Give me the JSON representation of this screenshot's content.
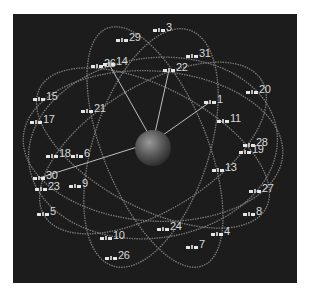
{
  "diagram": {
    "type": "satellite-constellation",
    "background_color": "#1c1c1c",
    "orbit_color": "#8a8a8a",
    "link_color": "#bfbfbf",
    "label_color": "#d9d9d9",
    "earth": {
      "cx": 140,
      "cy": 134,
      "r": 18
    },
    "satellites": [
      {
        "id": "3",
        "label": "3",
        "x": 140,
        "y": 12
      },
      {
        "id": "29",
        "label": "29",
        "x": 103,
        "y": 22
      },
      {
        "id": "31",
        "label": "31",
        "x": 173,
        "y": 38
      },
      {
        "id": "14",
        "label": "14",
        "x": 90,
        "y": 46
      },
      {
        "id": "26a",
        "label": "26",
        "x": 78,
        "y": 48
      },
      {
        "id": "22",
        "label": "22",
        "x": 150,
        "y": 52
      },
      {
        "id": "20",
        "label": "20",
        "x": 233,
        "y": 74
      },
      {
        "id": "15",
        "label": "15",
        "x": 20,
        "y": 81
      },
      {
        "id": "1",
        "label": "1",
        "x": 191,
        "y": 84
      },
      {
        "id": "21",
        "label": "21",
        "x": 68,
        "y": 93
      },
      {
        "id": "11",
        "label": "11",
        "x": 204,
        "y": 103
      },
      {
        "id": "17",
        "label": "17",
        "x": 17,
        "y": 104
      },
      {
        "id": "28",
        "label": "28",
        "x": 230,
        "y": 127
      },
      {
        "id": "19",
        "label": "19",
        "x": 226,
        "y": 134
      },
      {
        "id": "18",
        "label": "18",
        "x": 33,
        "y": 138
      },
      {
        "id": "6",
        "label": "6",
        "x": 58,
        "y": 138
      },
      {
        "id": "13",
        "label": "13",
        "x": 199,
        "y": 152
      },
      {
        "id": "30",
        "label": "30",
        "x": 20,
        "y": 160
      },
      {
        "id": "23",
        "label": "23",
        "x": 22,
        "y": 171
      },
      {
        "id": "9",
        "label": "9",
        "x": 56,
        "y": 168
      },
      {
        "id": "27",
        "label": "27",
        "x": 236,
        "y": 173
      },
      {
        "id": "5",
        "label": "5",
        "x": 24,
        "y": 196
      },
      {
        "id": "8",
        "label": "8",
        "x": 230,
        "y": 196
      },
      {
        "id": "24",
        "label": "24",
        "x": 144,
        "y": 211
      },
      {
        "id": "4",
        "label": "4",
        "x": 198,
        "y": 216
      },
      {
        "id": "10",
        "label": "10",
        "x": 87,
        "y": 220
      },
      {
        "id": "7",
        "label": "7",
        "x": 173,
        "y": 229
      },
      {
        "id": "26b",
        "label": "26",
        "x": 92,
        "y": 240
      }
    ],
    "links": [
      {
        "from": "earth",
        "to": "14"
      },
      {
        "from": "earth",
        "to": "22"
      },
      {
        "from": "earth",
        "to": "1"
      },
      {
        "from": "earth",
        "to": "30"
      }
    ]
  }
}
